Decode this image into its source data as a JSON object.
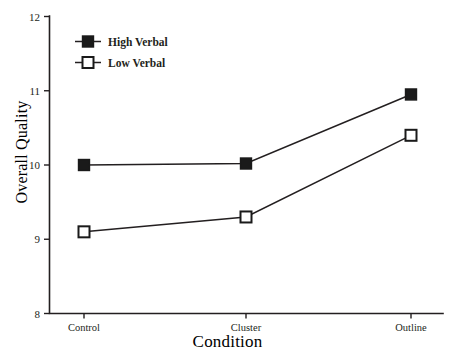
{
  "chart_data": {
    "type": "line",
    "title": "",
    "xlabel": "Condition",
    "ylabel": "Overall Quality",
    "categories": [
      "Control",
      "Cluster",
      "Outline"
    ],
    "ylim": [
      8,
      12
    ],
    "yticks": [
      8,
      9,
      10,
      11,
      12
    ],
    "ytick_labels": [
      "8",
      "9",
      "10",
      "11",
      "12"
    ],
    "grid": false,
    "legend_position": "top-left",
    "series": [
      {
        "name": "High Verbal",
        "marker": "filled-square",
        "values": [
          10.0,
          10.02,
          10.95
        ]
      },
      {
        "name": "Low Verbal",
        "marker": "open-square",
        "values": [
          9.1,
          9.3,
          10.4
        ]
      }
    ]
  },
  "legend": {
    "entries": [
      {
        "label": "High Verbal",
        "marker": "filled-square"
      },
      {
        "label": "Low Verbal",
        "marker": "open-square"
      }
    ]
  },
  "axes": {
    "y_title": "Overall Quality",
    "x_title": "Condition",
    "y_tick_12": "12",
    "y_tick_11": "11",
    "y_tick_10": "10",
    "y_tick_9": "9",
    "y_tick_8": "8",
    "x_tick_1": "Control",
    "x_tick_2": "Cluster",
    "x_tick_3": "Outline"
  },
  "colors": {
    "ink": "#231f20",
    "background": "#ffffff",
    "marker_fill": "#1a1a1a"
  }
}
